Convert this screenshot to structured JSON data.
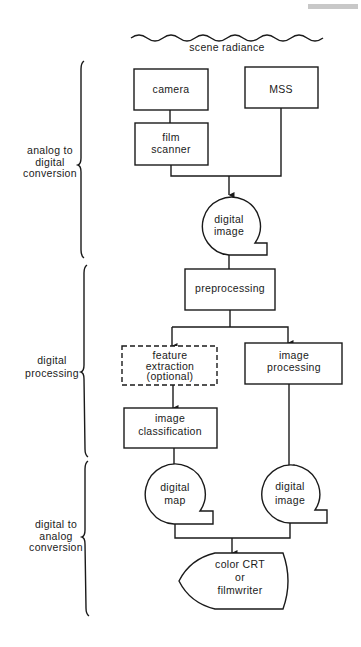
{
  "diagram": {
    "input": {
      "label": "scene radiance",
      "icon": "wave-icon"
    },
    "sections": [
      {
        "id": "analog-to-digital",
        "lines": [
          "analog to",
          "digital",
          "conversion"
        ]
      },
      {
        "id": "digital-processing",
        "lines": [
          "digital",
          "processing"
        ]
      },
      {
        "id": "digital-to-analog",
        "lines": [
          "digital to",
          "analog",
          "conversion"
        ]
      }
    ],
    "nodes": {
      "camera": {
        "lines": [
          "camera"
        ],
        "shape": "process"
      },
      "mss": {
        "lines": [
          "MSS"
        ],
        "shape": "process"
      },
      "film_scanner": {
        "lines": [
          "film",
          "scanner"
        ],
        "shape": "process"
      },
      "digital_image_1": {
        "lines": [
          "digital",
          "image"
        ],
        "shape": "stored-data"
      },
      "preprocessing": {
        "lines": [
          "preprocessing"
        ],
        "shape": "process"
      },
      "feature_extraction": {
        "lines": [
          "feature",
          "extraction",
          "(optional)"
        ],
        "shape": "optional-process"
      },
      "image_processing": {
        "lines": [
          "image",
          "processing"
        ],
        "shape": "process"
      },
      "image_classification": {
        "lines": [
          "image",
          "classification"
        ],
        "shape": "process"
      },
      "digital_map": {
        "lines": [
          "digital",
          "map"
        ],
        "shape": "stored-data"
      },
      "digital_image_2": {
        "lines": [
          "digital",
          "image"
        ],
        "shape": "stored-data"
      },
      "output_display": {
        "lines": [
          "color CRT",
          "or",
          "filmwriter"
        ],
        "shape": "display"
      }
    },
    "edges": [
      [
        "camera",
        "film_scanner"
      ],
      [
        "film_scanner",
        "digital_image_1"
      ],
      [
        "mss",
        "digital_image_1"
      ],
      [
        "digital_image_1",
        "preprocessing"
      ],
      [
        "preprocessing",
        "feature_extraction"
      ],
      [
        "preprocessing",
        "image_processing"
      ],
      [
        "feature_extraction",
        "image_classification"
      ],
      [
        "image_classification",
        "digital_map"
      ],
      [
        "image_processing",
        "digital_image_2"
      ],
      [
        "digital_map",
        "output_display"
      ],
      [
        "digital_image_2",
        "output_display"
      ]
    ]
  }
}
